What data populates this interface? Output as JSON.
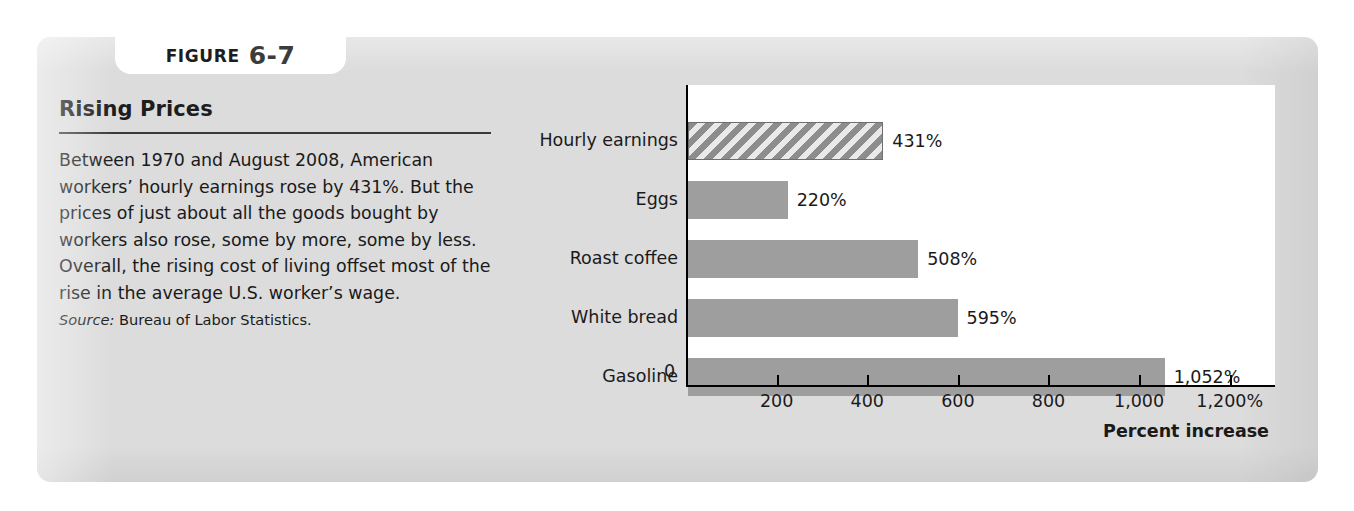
{
  "figure": {
    "tab_word": "FIGURE",
    "tab_number": "6-7",
    "title": "Rising Prices",
    "body": "Between 1970 and August 2008, American workers’ hourly earnings rose by 431%. But the prices of just about all the goods bought by workers also rose, some by more, some by less. Overall, the rising cost of living offset most of the rise in the average U.S. worker’s wage.",
    "source_label": "Source:",
    "source_text": " Bureau of Labor Statistics."
  },
  "chart_data": {
    "type": "bar",
    "orientation": "horizontal",
    "title": "Rising Prices",
    "categories": [
      "Hourly earnings",
      "Eggs",
      "Roast coffee",
      "White bread",
      "Gasoline"
    ],
    "values": [
      431,
      220,
      508,
      595,
      1052
    ],
    "value_labels": [
      "431%",
      "220%",
      "508%",
      "595%",
      "1,052%"
    ],
    "highlight_index": 0,
    "highlight_style": "hatched",
    "xlabel": "Percent increase",
    "ylabel": "",
    "xlim": [
      0,
      1300
    ],
    "xticks": [
      0,
      200,
      400,
      600,
      800,
      1000,
      1200
    ],
    "xtick_labels": [
      "0",
      "200",
      "400",
      "600",
      "800",
      "1,000",
      "1,200%"
    ],
    "grid": false,
    "legend": null,
    "colors": {
      "bar": "#9e9e9e",
      "hatch_line": "#8d8d8d",
      "hatch_bg": "#e9e9e9",
      "plot_background": "#ffffff",
      "card_background": "#dcdcdc",
      "axis": "#000000",
      "text": "#1a1a1a"
    }
  }
}
